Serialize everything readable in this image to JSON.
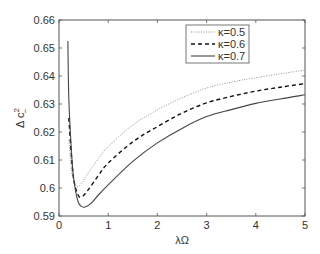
{
  "chart_data": {
    "type": "line",
    "title": "",
    "xlabel": "λΩ",
    "ylabel": "Δ c²₋",
    "ylabel_parts": {
      "base": "Δ c",
      "sup": "2",
      "sub": "−"
    },
    "xlim": [
      0,
      5
    ],
    "ylim": [
      0.59,
      0.66
    ],
    "xticks": [
      0,
      1,
      2,
      3,
      4,
      5
    ],
    "xtick_labels": [
      "0",
      "1",
      "2",
      "3",
      "4",
      "5"
    ],
    "yticks": [
      0.59,
      0.6,
      0.61,
      0.62,
      0.63,
      0.64,
      0.65,
      0.66
    ],
    "ytick_labels": [
      "0.59",
      "0.6",
      "0.61",
      "0.62",
      "0.63",
      "0.64",
      "0.65",
      "0.66"
    ],
    "grid": false,
    "legend_position": "upper right",
    "series": [
      {
        "name": "κ=0.5",
        "style": "dotted",
        "color": "#888888",
        "x": [
          0.2,
          0.25,
          0.3,
          0.37,
          0.45,
          0.6,
          0.8,
          1.0,
          1.5,
          2.0,
          2.5,
          3.0,
          3.5,
          4.0,
          4.5,
          5.0
        ],
        "y": [
          0.617,
          0.607,
          0.6025,
          0.6005,
          0.6015,
          0.6055,
          0.6105,
          0.6148,
          0.6225,
          0.6279,
          0.6322,
          0.6357,
          0.6378,
          0.6394,
          0.6408,
          0.6421
        ]
      },
      {
        "name": "κ=0.6",
        "style": "dashed",
        "color": "#111111",
        "x": [
          0.2,
          0.25,
          0.3,
          0.38,
          0.46,
          0.6,
          0.8,
          1.0,
          1.5,
          2.0,
          2.5,
          3.0,
          3.5,
          4.0,
          4.5,
          5.0
        ],
        "y": [
          0.625,
          0.612,
          0.603,
          0.5978,
          0.5968,
          0.5995,
          0.6045,
          0.6089,
          0.6165,
          0.6219,
          0.6267,
          0.6304,
          0.6327,
          0.6346,
          0.636,
          0.6373
        ]
      },
      {
        "name": "κ=0.7",
        "style": "solid",
        "color": "#444444",
        "x": [
          0.18,
          0.2,
          0.25,
          0.3,
          0.38,
          0.45,
          0.53,
          0.65,
          0.8,
          1.0,
          1.5,
          2.0,
          2.5,
          3.0,
          3.5,
          4.0,
          4.5,
          5.0
        ],
        "y": [
          0.6525,
          0.632,
          0.614,
          0.603,
          0.5955,
          0.5935,
          0.5932,
          0.5945,
          0.5975,
          0.6011,
          0.6095,
          0.6161,
          0.6213,
          0.6255,
          0.628,
          0.6302,
          0.6318,
          0.6333
        ]
      }
    ]
  }
}
